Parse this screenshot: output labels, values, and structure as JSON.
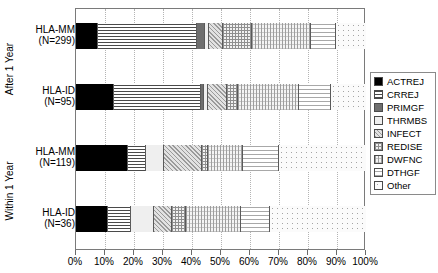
{
  "chart_data": {
    "type": "bar",
    "orientation": "horizontal",
    "stacked": true,
    "normalized_percent": true,
    "title": "",
    "xlabel": "",
    "ylabel": "",
    "xlim": [
      0,
      100
    ],
    "grid": true,
    "legend_position": "right",
    "xticks": [
      "0%",
      "10%",
      "20%",
      "30%",
      "40%",
      "50%",
      "60%",
      "70%",
      "80%",
      "90%",
      "100%"
    ],
    "xtick_values": [
      0,
      10,
      20,
      30,
      40,
      50,
      60,
      70,
      80,
      90,
      100
    ],
    "groups": [
      {
        "name": "After 1 Year",
        "categories": [
          "HLA-MM",
          "HLA-ID"
        ]
      },
      {
        "name": "Within 1 Year",
        "categories": [
          "HLA-MM",
          "HLA-ID"
        ]
      }
    ],
    "categories": [
      "HLA-MM\n(N=299)",
      "HLA-ID\n(N=95)",
      "HLA-MM\n(N=119)",
      "HLA-ID\n(N=36)"
    ],
    "series": [
      {
        "name": "ACTREJ",
        "values": [
          7.6,
          13.0,
          18.0,
          11.0
        ]
      },
      {
        "name": "CRREJ",
        "values": [
          34.0,
          30.0,
          6.0,
          8.0
        ]
      },
      {
        "name": "PRIMGF",
        "values": [
          2.8,
          1.0,
          0.0,
          0.0
        ]
      },
      {
        "name": "THRMBS",
        "values": [
          1.4,
          1.5,
          6.5,
          8.0
        ]
      },
      {
        "name": "INFECT",
        "values": [
          4.8,
          6.5,
          13.0,
          6.0
        ]
      },
      {
        "name": "REDISE",
        "values": [
          10.0,
          4.0,
          2.0,
          5.0
        ]
      },
      {
        "name": "DWFNC",
        "values": [
          20.4,
          21.0,
          12.0,
          19.0
        ]
      },
      {
        "name": "DTHGF",
        "values": [
          8.6,
          11.0,
          12.5,
          10.0
        ]
      },
      {
        "name": "Other",
        "values": [
          10.4,
          12.0,
          30.0,
          33.0
        ]
      }
    ]
  },
  "axis": {
    "y_group_labels": [
      "After 1 Year",
      "Within 1 Year"
    ],
    "y_category_labels": [
      {
        "name": "HLA-MM",
        "n": "(N=299)"
      },
      {
        "name": "HLA-ID",
        "n": "(N=95)"
      },
      {
        "name": "HLA-MM",
        "n": "(N=119)"
      },
      {
        "name": "HLA-ID",
        "n": "(N=36)"
      }
    ]
  },
  "legend": {
    "items": [
      {
        "label": "ACTREJ",
        "pattern": "solid-black"
      },
      {
        "label": "CRREJ",
        "pattern": "horizontal-lines"
      },
      {
        "label": "PRIMGF",
        "pattern": "solid-dark-grey"
      },
      {
        "label": "THRMBS",
        "pattern": "blank-white"
      },
      {
        "label": "INFECT",
        "pattern": "diagonal-speckle"
      },
      {
        "label": "REDISE",
        "pattern": "cross-hatch"
      },
      {
        "label": "DWFNC",
        "pattern": "fine-grid"
      },
      {
        "label": "DTHGF",
        "pattern": "light-horizontal-lines"
      },
      {
        "label": "Other",
        "pattern": "open-dots"
      }
    ]
  },
  "colors": {
    "actrej": "#000000",
    "primgf": "#6e6e6e",
    "grid": "#b4b4b4",
    "frame": "#7a7a7a"
  }
}
